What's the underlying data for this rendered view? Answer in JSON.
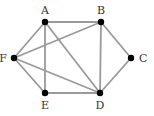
{
  "diagram": {
    "type": "graph",
    "nodes": [
      {
        "id": "A",
        "label": "A"
      },
      {
        "id": "B",
        "label": "B"
      },
      {
        "id": "C",
        "label": "C"
      },
      {
        "id": "D",
        "label": "D"
      },
      {
        "id": "E",
        "label": "E"
      },
      {
        "id": "F",
        "label": "F"
      }
    ],
    "edges": [
      [
        "A",
        "B"
      ],
      [
        "A",
        "F"
      ],
      [
        "A",
        "E"
      ],
      [
        "A",
        "D"
      ],
      [
        "B",
        "F"
      ],
      [
        "B",
        "D"
      ],
      [
        "B",
        "C"
      ],
      [
        "C",
        "D"
      ],
      [
        "F",
        "E"
      ],
      [
        "F",
        "D"
      ],
      [
        "E",
        "D"
      ]
    ],
    "colors": {
      "edge": "#9a9a9a",
      "node": "#000000",
      "label": "#333333"
    }
  }
}
